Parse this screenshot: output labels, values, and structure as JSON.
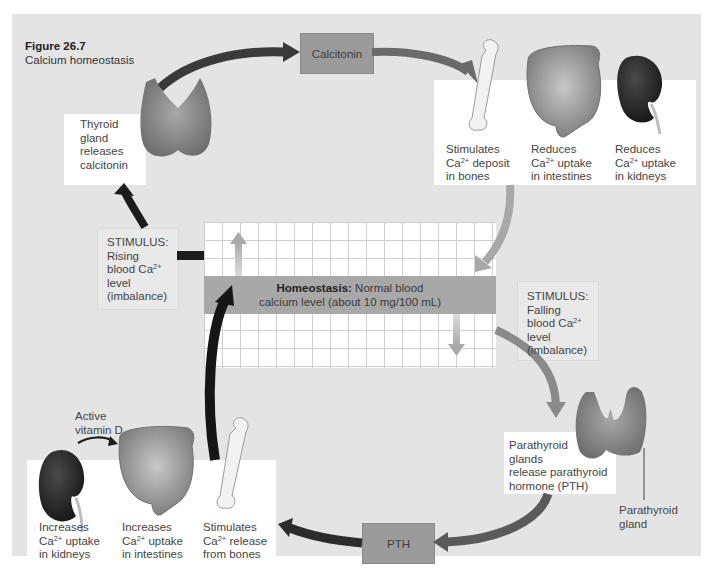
{
  "figure": {
    "number": "Figure 26.7",
    "title": "Calcium homeostasis"
  },
  "center": {
    "label_bold": "Homeostasis:",
    "label_rest_line1": "Normal blood",
    "label_line2": "calcium level (about 10 mg/100 mL)"
  },
  "top_loop": {
    "stimulus": [
      "STIMULUS:",
      "Rising",
      "blood Ca",
      "level",
      "(imbalance)"
    ],
    "gland_box": [
      "Thyroid",
      "gland",
      "releases",
      "calcitonin"
    ],
    "hormone": "Calcitonin",
    "effects": [
      {
        "line1": "Stimulates",
        "line2_prefix": "Ca",
        "line2_suffix": " deposit",
        "line3": "in bones",
        "organ": "bone"
      },
      {
        "line1": "Reduces",
        "line2_prefix": "Ca",
        "line2_suffix": " uptake",
        "line3": "in intestines",
        "organ": "intestines"
      },
      {
        "line1": "Reduces",
        "line2_prefix": "Ca",
        "line2_suffix": " uptake",
        "line3": "in kidneys",
        "organ": "kidney"
      }
    ]
  },
  "bottom_loop": {
    "stimulus": [
      "STIMULUS:",
      "Falling",
      "blood Ca",
      "level",
      "(imbalance)"
    ],
    "gland_box": [
      "Parathyroid",
      "glands",
      "release parathyroid",
      "hormone (PTH)"
    ],
    "gland_label": [
      "Parathyroid",
      "gland"
    ],
    "hormone": "PTH",
    "vitamin_label": [
      "Active",
      "vitamin D"
    ],
    "effects": [
      {
        "line1": "Increases",
        "line2_prefix": "Ca",
        "line2_suffix": " uptake",
        "line3": "in kidneys",
        "organ": "kidney"
      },
      {
        "line1": "Increases",
        "line2_prefix": "Ca",
        "line2_suffix": " uptake",
        "line3": "in intestines",
        "organ": "intestines"
      },
      {
        "line1": "Stimulates",
        "line2_prefix": "Ca",
        "line2_suffix": " release",
        "line3": "from bones",
        "organ": "bone"
      }
    ]
  },
  "superscript": "2+",
  "colors": {
    "panel": "#e4e4e4",
    "dark_arrow": "#1c1c1c",
    "mid_arrow": "#4a4a4a",
    "light_arrow": "#a5a5a5",
    "hormone_box": "#9b9b9b",
    "band": "#a8a8a8"
  }
}
